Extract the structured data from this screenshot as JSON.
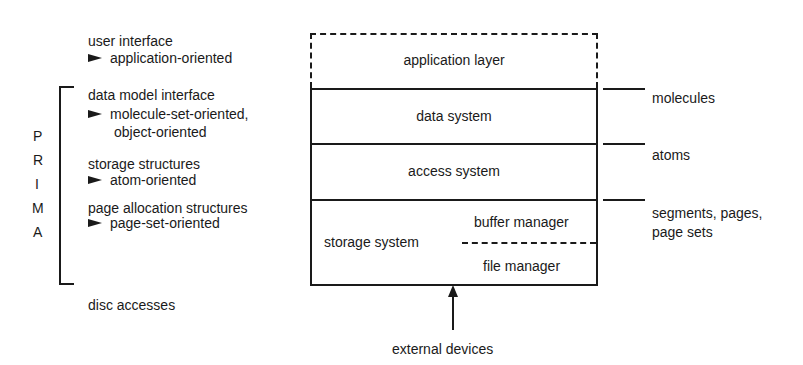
{
  "left_column": {
    "user_interface": {
      "title": "user interface",
      "detail": "application-oriented"
    },
    "data_model_interface": {
      "title": "data model interface",
      "detail_line1": "molecule-set-oriented,",
      "detail_line2": "object-oriented"
    },
    "storage_structures": {
      "title": "storage structures",
      "detail": "atom-oriented"
    },
    "page_allocation": {
      "title": "page allocation structures",
      "detail": "page-set-oriented"
    },
    "disc_accesses": "disc accesses",
    "prima_letters": [
      "P",
      "R",
      "I",
      "M",
      "A"
    ]
  },
  "layers": {
    "application": "application layer",
    "data_system": "data system",
    "access_system": "access system",
    "storage_system": "storage system",
    "buffer_manager": "buffer manager",
    "file_manager": "file manager"
  },
  "right_labels": {
    "molecules": "molecules",
    "atoms": "atoms",
    "segments_line1": "segments, pages,",
    "segments_line2": "page sets"
  },
  "bottom": {
    "external_devices": "external devices"
  },
  "colors": {
    "ink": "#1a1a1a",
    "background": "#ffffff"
  }
}
